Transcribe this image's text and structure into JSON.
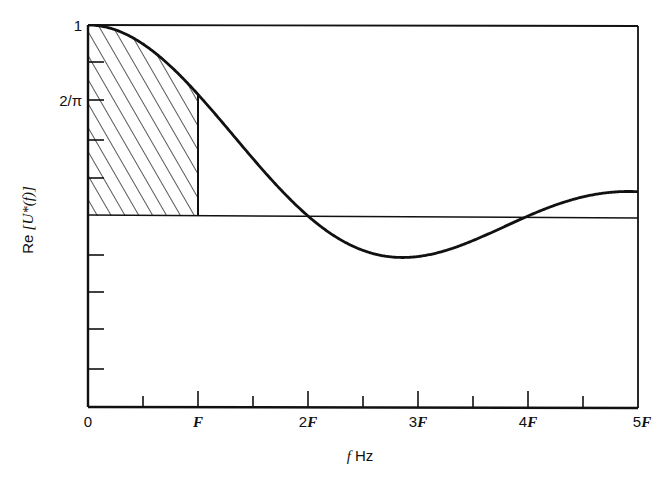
{
  "chart_data": {
    "type": "line",
    "title": "",
    "xlabel": "f Hz",
    "ylabel": "Re [U*(f)]",
    "x_tick_labels": [
      "0",
      "F",
      "2F",
      "3F",
      "4F",
      "5F"
    ],
    "x_ticks_major": [
      0,
      1,
      2,
      3,
      4,
      5
    ],
    "x_ticks_minor": [
      0.5,
      1.5,
      2.5,
      3.5,
      4.5
    ],
    "y_tick_labels": [
      {
        "value": 1,
        "label": "1"
      },
      {
        "value": 0.6366,
        "label": "2/π"
      }
    ],
    "y_ticks_unlabeled": [
      0.8,
      0.4,
      0.2,
      -0.2,
      -0.4,
      -0.6,
      -0.8
    ],
    "xlim": [
      0,
      5
    ],
    "ylim": [
      -1.0,
      1.0
    ],
    "grid": false,
    "legend": null,
    "series": [
      {
        "name": "Re[U*(f)] = sin(πf/2F)/(πf/2F)",
        "x": [
          0,
          0.25,
          0.5,
          0.75,
          1.0,
          1.25,
          1.5,
          1.75,
          2.0,
          2.25,
          2.5,
          2.75,
          2.86,
          3.0,
          3.25,
          3.5,
          3.75,
          4.0,
          4.25,
          4.5,
          4.75,
          5.0
        ],
        "y": [
          1.0,
          0.974,
          0.9,
          0.784,
          0.637,
          0.471,
          0.3,
          0.139,
          0.0,
          -0.1,
          -0.18,
          -0.212,
          -0.217,
          -0.212,
          -0.172,
          -0.129,
          -0.06,
          0.0,
          0.049,
          0.1,
          0.129,
          0.127
        ]
      }
    ],
    "annotations": [
      {
        "type": "hatched-region",
        "x_range": [
          0,
          1
        ],
        "description": "area under curve from 0 to F shaded with diagonal hatching"
      },
      {
        "type": "reference-line",
        "y": 0,
        "description": "horizontal zero line"
      }
    ]
  },
  "axes": {
    "x_title_italic": "f",
    "x_title_unit": "Hz",
    "y_title_prefix": "Re",
    "y_title_bracket": "[U*(f)]"
  }
}
